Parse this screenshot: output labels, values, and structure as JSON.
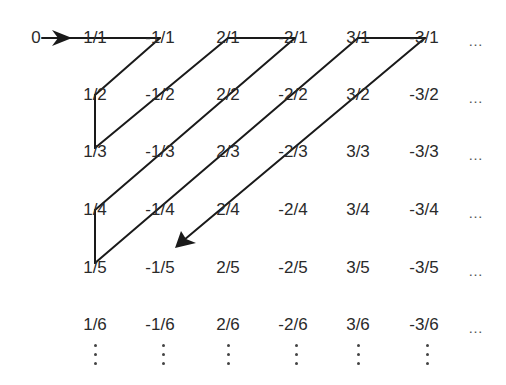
{
  "diagram": {
    "start_label": "0",
    "columns": [
      "1",
      "-1",
      "2",
      "-2",
      "3",
      "-3"
    ],
    "rows": [
      [
        "1/1",
        "-1/1",
        "2/1",
        "-2/1",
        "3/1",
        "-3/1"
      ],
      [
        "1/2",
        "-1/2",
        "2/2",
        "-2/2",
        "3/2",
        "-3/2"
      ],
      [
        "1/3",
        "-1/3",
        "2/3",
        "-2/3",
        "3/3",
        "-3/3"
      ],
      [
        "1/4",
        "-1/4",
        "2/4",
        "-2/4",
        "3/4",
        "-3/4"
      ],
      [
        "1/5",
        "-1/5",
        "2/5",
        "-2/5",
        "3/5",
        "-3/5"
      ],
      [
        "1/6",
        "-1/6",
        "2/6",
        "-2/6",
        "3/6",
        "-3/6"
      ]
    ],
    "row_ellipsis": "…",
    "column_ellipsis": "⋮",
    "path_order": [
      "0",
      "1/1",
      "-1/1",
      "1/2",
      "1/3",
      "-1/2",
      "2/1",
      "-2/1",
      "2/2",
      "-1/3",
      "1/4",
      "1/5",
      "-1/4",
      "2/3",
      "-2/2",
      "3/1",
      "-3/1",
      "3/2",
      "-2/3",
      "2/4",
      "-1/5"
    ],
    "line_color": "#1a1a1a",
    "text_color": "#2a2a2a"
  }
}
